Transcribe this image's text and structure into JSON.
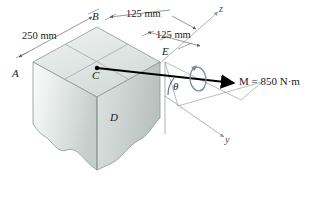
{
  "figure": {
    "background_color": "#ffffff"
  },
  "points": [
    {
      "id": "A",
      "label": "A",
      "x": 16,
      "y": 74
    },
    {
      "id": "B",
      "label": "B",
      "x": 95,
      "y": 17
    },
    {
      "id": "C",
      "label": "C",
      "x": 95,
      "y": 72
    },
    {
      "id": "D",
      "label": "D",
      "x": 114,
      "y": 118
    },
    {
      "id": "E",
      "label": "E",
      "x": 165,
      "y": 52
    }
  ],
  "axes": [
    {
      "id": "z",
      "label": "z",
      "x": 220,
      "y": 5
    },
    {
      "id": "y",
      "label": "y",
      "x": 226,
      "y": 138
    }
  ],
  "dimensions": [
    {
      "id": "dim-250",
      "label": "250 mm",
      "x": 24,
      "y": 38
    },
    {
      "id": "dim-125-top",
      "label": "125 mm",
      "x": 131,
      "y": 16
    },
    {
      "id": "dim-125-lower",
      "label": "125 mm",
      "x": 160,
      "y": 37
    }
  ],
  "moment": {
    "id": "moment-vector",
    "symbol": "M",
    "equals": " = ",
    "value": "850",
    "unit": "N·m",
    "full_label": "M = 850 N·m",
    "label_x": 239,
    "label_y": 82,
    "arrow_color": "#000000"
  },
  "angle": {
    "id": "theta",
    "label": "θ",
    "x": 175,
    "y": 86
  },
  "colors": {
    "block_top": "#e3e8e6",
    "block_left": "#d6dbd9",
    "block_front": "#cdd3d1",
    "block_edge": "#8d9694",
    "axis_line": "#9aa0a6",
    "dimension_line": "#6b6b6b",
    "text": "#1a1a1a",
    "moment_curl": "#7a8a98"
  }
}
